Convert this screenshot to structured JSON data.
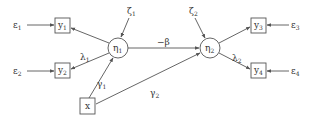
{
  "diagram": {
    "type": "structural-equation-path-diagram",
    "colors": {
      "line": "#555555",
      "text": "#333333",
      "background": "#ffffff"
    },
    "nodes": {
      "eps1": {
        "kind": "error",
        "symbol": "ε",
        "sub": "1",
        "x": 20,
        "y": 25
      },
      "eps2": {
        "kind": "error",
        "symbol": "ε",
        "sub": "2",
        "x": 20,
        "y": 71
      },
      "eps3": {
        "kind": "error",
        "symbol": "ε",
        "sub": "3",
        "x": 294,
        "y": 25
      },
      "eps4": {
        "kind": "error",
        "symbol": "ε",
        "sub": "4",
        "x": 294,
        "y": 71
      },
      "y1": {
        "kind": "observed",
        "symbol": "y",
        "sub": "1",
        "x": 62,
        "y": 25
      },
      "y2": {
        "kind": "observed",
        "symbol": "y",
        "sub": "2",
        "x": 62,
        "y": 71
      },
      "y3": {
        "kind": "observed",
        "symbol": "y",
        "sub": "3",
        "x": 259,
        "y": 25
      },
      "y4": {
        "kind": "observed",
        "symbol": "y",
        "sub": "4",
        "x": 259,
        "y": 71
      },
      "x": {
        "kind": "observed",
        "symbol": "x",
        "sub": "",
        "x": 88,
        "y": 106
      },
      "eta1": {
        "kind": "latent",
        "symbol": "η",
        "sub": "1",
        "x": 118,
        "y": 48
      },
      "eta2": {
        "kind": "latent",
        "symbol": "η",
        "sub": "2",
        "x": 210,
        "y": 48
      },
      "zeta1": {
        "kind": "disturbance",
        "symbol": "ζ",
        "sub": "1",
        "x": 131,
        "y": 12
      },
      "zeta2": {
        "kind": "disturbance",
        "symbol": "ζ",
        "sub": "2",
        "x": 193,
        "y": 12
      }
    },
    "edges": [
      {
        "from": "eps1",
        "to": "y1",
        "label": ""
      },
      {
        "from": "eps2",
        "to": "y2",
        "label": ""
      },
      {
        "from": "eps3",
        "to": "y3",
        "label": ""
      },
      {
        "from": "eps4",
        "to": "y4",
        "label": ""
      },
      {
        "from": "eta1",
        "to": "y1",
        "label": ""
      },
      {
        "from": "eta1",
        "to": "y2",
        "label": "λ1"
      },
      {
        "from": "eta2",
        "to": "y3",
        "label": ""
      },
      {
        "from": "eta2",
        "to": "y4",
        "label": "λ2"
      },
      {
        "from": "zeta1",
        "to": "eta1",
        "label": ""
      },
      {
        "from": "zeta2",
        "to": "eta2",
        "label": ""
      },
      {
        "from": "eta1",
        "to": "eta2",
        "label": "−β"
      },
      {
        "from": "x",
        "to": "eta1",
        "label": "γ1"
      },
      {
        "from": "x",
        "to": "eta2",
        "label": "γ2"
      }
    ],
    "labels": {
      "eps1": {
        "sym": "ε",
        "sub": "1"
      },
      "eps2": {
        "sym": "ε",
        "sub": "2"
      },
      "eps3": {
        "sym": "ε",
        "sub": "3"
      },
      "eps4": {
        "sym": "ε",
        "sub": "4"
      },
      "y1": {
        "sym": "y",
        "sub": "1"
      },
      "y2": {
        "sym": "y",
        "sub": "2"
      },
      "y3": {
        "sym": "y",
        "sub": "3"
      },
      "y4": {
        "sym": "y",
        "sub": "4"
      },
      "x": {
        "sym": "x"
      },
      "eta1": {
        "sym": "η",
        "sub": "1"
      },
      "eta2": {
        "sym": "η",
        "sub": "2"
      },
      "zeta1": {
        "sym": "ζ",
        "sub": "1"
      },
      "zeta2": {
        "sym": "ζ",
        "sub": "2"
      },
      "beta": {
        "sym": "−β"
      },
      "lambda1": {
        "sym": "λ",
        "sub": "1"
      },
      "lambda2": {
        "sym": "λ",
        "sub": "2"
      },
      "gamma1": {
        "sym": "γ",
        "sub": "1"
      },
      "gamma2": {
        "sym": "γ",
        "sub": "2"
      }
    }
  }
}
